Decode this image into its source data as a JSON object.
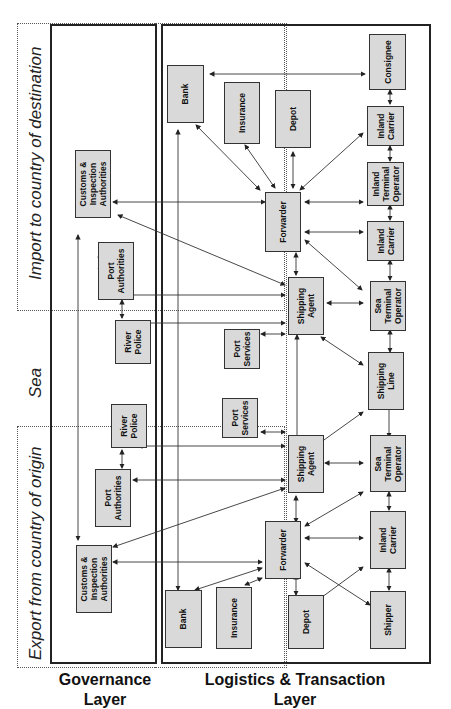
{
  "zones": {
    "import": "Import to country of destination",
    "sea": "Sea",
    "export": "Export from country of origin"
  },
  "layers": {
    "governance": "Governance\nLayer",
    "logistics": "Logistics & Transaction\nLayer"
  },
  "nodes": {
    "import_customs": "Customs &\nInspection\nAuthorities",
    "import_port_auth": "Port\nAuthorities",
    "import_river_police": "River\nPolice",
    "import_bank": "Bank",
    "import_insurance": "Insurance",
    "import_depot": "Depot",
    "import_consignee": "Consignee",
    "import_inland_carrier_1": "Inland\nCarrier",
    "import_inland_terminal": "Inland\nTerminal\nOperator",
    "import_inland_carrier_2": "Inland\nCarrier",
    "import_forwarder": "Forwarder",
    "import_shipping_agent": "Shipping\nAgent",
    "import_sea_terminal": "Sea\nTerminal\nOperator",
    "import_port_services": "Port\nServices",
    "shipping_line": "Shipping\nLine",
    "export_port_services": "Port\nServices",
    "export_river_police": "River\nPolice",
    "export_port_auth": "Port\nAuthorities",
    "export_customs": "Customs &\nInspection\nAuthorities",
    "export_shipping_agent": "Shipping\nAgent",
    "export_sea_terminal": "Sea\nTerminal\nOperator",
    "export_forwarder": "Forwarder",
    "export_inland_carrier": "Inland\nCarrier",
    "export_bank": "Bank",
    "export_insurance": "Insurance",
    "export_depot": "Depot",
    "export_shipper": "Shipper"
  }
}
